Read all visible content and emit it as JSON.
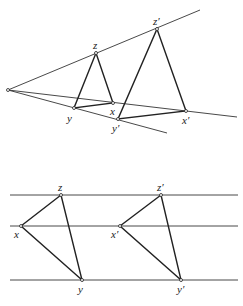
{
  "figure_top": {
    "title": "Perspective (central projection) of triangle xyz to x'y'z'",
    "center": {
      "x": 8,
      "y": 90
    },
    "rays": [
      {
        "name": "ray-through-z",
        "x2": 200,
        "y2": 10
      },
      {
        "name": "ray-through-x",
        "x2": 237,
        "y2": 117
      },
      {
        "name": "ray-through-y",
        "x2": 167,
        "y2": 133
      }
    ],
    "triangle": {
      "points": {
        "z": [
          96,
          53
        ],
        "x": [
          113,
          103
        ],
        "y": [
          74,
          108
        ]
      },
      "labels": {
        "z": "z",
        "x": "x",
        "y": "y"
      }
    },
    "triangle_prime": {
      "points": {
        "z": [
          157,
          29
        ],
        "x": [
          186,
          111
        ],
        "y": [
          118,
          119
        ]
      },
      "labels": {
        "z": "z′",
        "x": "x′",
        "y": "y′"
      }
    }
  },
  "figure_bottom": {
    "title": "Parallel projection of triangle xyz to x'y'z'",
    "lines_y": [
      195,
      226,
      280
    ],
    "line_x_start": 10,
    "line_x_end": 238,
    "triangle": {
      "points": {
        "z": [
          61,
          195
        ],
        "x": [
          21,
          226
        ],
        "y": [
          82,
          280
        ]
      },
      "labels": {
        "z": "z",
        "x": "x",
        "y": "y"
      }
    },
    "triangle_prime": {
      "points": {
        "z": [
          161,
          195
        ],
        "x": [
          120,
          226
        ],
        "y": [
          181,
          280
        ]
      },
      "labels": {
        "z": "z′",
        "x": "x′",
        "y": "y′"
      }
    }
  },
  "colors": {
    "line": "#333333",
    "edge": "#222222",
    "background": "#ffffff"
  }
}
